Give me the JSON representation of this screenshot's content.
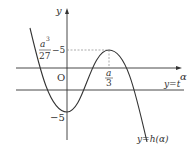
{
  "diagram": {
    "type": "function-graph",
    "axes": {
      "horizontal_label": "α",
      "vertical_label": "y",
      "origin_label": "O"
    },
    "curve": {
      "label": "y=h(α)",
      "local_max": {
        "x_label": "a/3",
        "x_num": "a",
        "x_den": "3",
        "y_label": "5"
      },
      "local_min": {
        "y_label": "−5"
      }
    },
    "line": {
      "label": "y=t"
    },
    "annotation": {
      "num": "a",
      "sup": "3",
      "den": "27",
      "suffix": "−5"
    },
    "colors": {
      "stroke": "#333333",
      "dashed": "#888888",
      "background": "#ffffff"
    }
  }
}
